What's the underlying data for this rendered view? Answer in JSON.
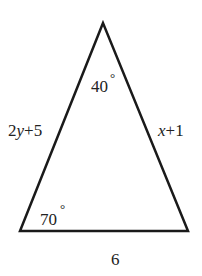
{
  "diagram": {
    "type": "triangle",
    "stroke_color": "#1a1a1a",
    "background": "#ffffff",
    "vertices": {
      "apex": [
        103,
        23
      ],
      "bottom_left": [
        20,
        231
      ],
      "bottom_right": [
        188,
        231
      ]
    },
    "angles": {
      "apex": {
        "value": "40",
        "unit": "°"
      },
      "bottom_left": {
        "value": "70",
        "unit": "°"
      }
    },
    "sides": {
      "left": {
        "coef": "2",
        "var": "y",
        "rest": "+5"
      },
      "right": {
        "var": "x",
        "rest": "+1"
      },
      "base": {
        "label": "6"
      }
    }
  }
}
